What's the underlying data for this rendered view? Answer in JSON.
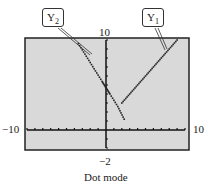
{
  "chart_data": {
    "type": "scatter",
    "title": "",
    "caption": "Dot mode",
    "xlabel": "",
    "ylabel": "",
    "xlim": [
      -10,
      10
    ],
    "ylim": [
      -2,
      10
    ],
    "tick_labels": {
      "xmin": "−10",
      "xmax": "10",
      "ymax": "10",
      "ymin": "−2"
    },
    "grid": false,
    "background": "#d9d9d9",
    "series": [
      {
        "name": "Y1",
        "label": "Y",
        "subscript": "1",
        "x": [
          2,
          3,
          4,
          5,
          6,
          7,
          8,
          9
        ],
        "y": [
          3,
          4,
          5,
          6,
          7,
          8,
          9,
          10
        ]
      },
      {
        "name": "Y2",
        "label": "Y",
        "subscript": "2",
        "x": [
          -3.5,
          -2.5,
          -1.5,
          -0.5,
          0,
          0.5,
          1.5,
          2.3
        ],
        "y": [
          9.6,
          8.2,
          6.8,
          5.4,
          4.7,
          4.0,
          2.6,
          1.2
        ]
      }
    ]
  },
  "labels": {
    "y1_main": "Y",
    "y1_sub": "1",
    "y2_main": "Y",
    "y2_sub": "2",
    "ymax": "10",
    "ymin": "−2",
    "xmin": "−10",
    "xmax": "10",
    "caption": "Dot mode"
  }
}
